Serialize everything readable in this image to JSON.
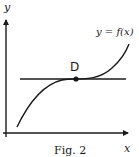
{
  "figure": {
    "caption": "Fig. 2",
    "axes": {
      "x_label": "x",
      "y_label": "y"
    },
    "curve": {
      "label": "y = f(x)",
      "description": "increasing cubic-like curve with horizontal tangent at inflection point D"
    },
    "point": {
      "label": "D"
    },
    "tangent_line": {
      "orientation": "horizontal",
      "description": "horizontal tangent line through D"
    },
    "colors": {
      "stroke": "#1a1a1a",
      "background": "#ffffff"
    }
  }
}
